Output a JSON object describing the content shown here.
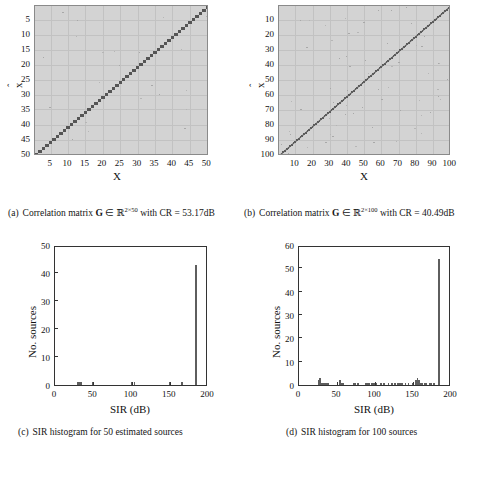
{
  "figure": {
    "panels": [
      {
        "id": "a",
        "type": "matrix",
        "caption_label": "(a)",
        "caption_text_pre": "Correlation matrix",
        "caption_symbol": "G",
        "caption_in": "∈",
        "caption_set": "ℝ",
        "caption_exp": "2×50",
        "caption_text_post": "with CR = 53.17dB",
        "xlabel": "X",
        "ylabel": "x",
        "ylabel_hat": "ˆ",
        "xticks": [
          5,
          10,
          15,
          20,
          25,
          30,
          35,
          40,
          45,
          50
        ],
        "yticks": [
          5,
          10,
          15,
          20,
          25,
          30,
          35,
          40,
          45,
          50
        ],
        "xlim": [
          0.5,
          50.5
        ],
        "ylim": [
          0.5,
          50.5
        ],
        "n": 50,
        "cr_db": 53.17,
        "diagonal": "anti-diagonal, descending left-to-right, dashed/stippled dark marks"
      },
      {
        "id": "b",
        "type": "matrix",
        "caption_label": "(b)",
        "caption_text_pre": "Correlation matrix",
        "caption_symbol": "G",
        "caption_in": "∈",
        "caption_set": "ℝ",
        "caption_exp": "2×100",
        "caption_text_post": "with CR = 40.49dB",
        "xlabel": "X",
        "ylabel": "x",
        "ylabel_hat": "ˆ",
        "xticks": [
          10,
          20,
          30,
          40,
          50,
          60,
          70,
          80,
          90,
          100
        ],
        "yticks": [
          10,
          20,
          30,
          40,
          50,
          60,
          70,
          80,
          90,
          100
        ],
        "xlim": [
          0.5,
          100.5
        ],
        "ylim": [
          0.5,
          100.5
        ],
        "n": 100,
        "cr_db": 40.49,
        "diagonal": "anti-diagonal, descending left-to-right, near-continuous dark line"
      },
      {
        "id": "c",
        "type": "histogram",
        "caption_label": "(c)",
        "caption_full": "SIR histogram for 50 estimated sources",
        "xlabel": "SIR  (dB)",
        "ylabel": "No. sources",
        "xticks": [
          0,
          50,
          100,
          150,
          200
        ],
        "yticks": [
          0,
          10,
          20,
          30,
          40,
          50
        ],
        "xlim": [
          0,
          200
        ],
        "ylim": [
          0,
          50
        ]
      },
      {
        "id": "d",
        "type": "histogram",
        "caption_label": "(d)",
        "caption_full": "SIR histogram for 100 sources",
        "xlabel": "SIR  (dB)",
        "ylabel": "No. sources",
        "xticks": [
          0,
          50,
          100,
          150,
          200
        ],
        "yticks": [
          0,
          10,
          20,
          30,
          40,
          50,
          60
        ],
        "xlim": [
          0,
          200
        ],
        "ylim": [
          0,
          60
        ]
      }
    ]
  },
  "chart_data": [
    {
      "type": "heatmap",
      "id": "a",
      "title": "Correlation matrix G ∈ R^(2×50) with CR = 53.17dB",
      "xlabel": "X",
      "ylabel": "x̂",
      "xlim": [
        0.5,
        50.5
      ],
      "ylim": [
        0.5,
        50.5
      ],
      "xticks": [
        5,
        10,
        15,
        20,
        25,
        30,
        35,
        40,
        45,
        50
      ],
      "yticks": [
        5,
        10,
        15,
        20,
        25,
        30,
        35,
        40,
        45,
        50
      ],
      "grid": true,
      "background_gray": "#d3d3d3",
      "structure": "permuted identity: one dark cell per column along the anti-diagonal (x + x_hat ≈ 51)",
      "n_sources": 50,
      "cr_db": 53.17,
      "diagonal_cells": [
        [
          1,
          50
        ],
        [
          2,
          49
        ],
        [
          3,
          48
        ],
        [
          4,
          47
        ],
        [
          5,
          46
        ],
        [
          6,
          45
        ],
        [
          7,
          44
        ],
        [
          8,
          43
        ],
        [
          9,
          42
        ],
        [
          10,
          41
        ],
        [
          11,
          40
        ],
        [
          12,
          39
        ],
        [
          13,
          38
        ],
        [
          14,
          37
        ],
        [
          15,
          36
        ],
        [
          16,
          35
        ],
        [
          17,
          34
        ],
        [
          18,
          33
        ],
        [
          19,
          32
        ],
        [
          20,
          31
        ],
        [
          21,
          30
        ],
        [
          22,
          29
        ],
        [
          23,
          28
        ],
        [
          24,
          27
        ],
        [
          25,
          26
        ],
        [
          26,
          25
        ],
        [
          27,
          24
        ],
        [
          28,
          23
        ],
        [
          29,
          22
        ],
        [
          30,
          21
        ],
        [
          31,
          20
        ],
        [
          32,
          19
        ],
        [
          33,
          18
        ],
        [
          34,
          17
        ],
        [
          35,
          16
        ],
        [
          36,
          15
        ],
        [
          37,
          14
        ],
        [
          38,
          13
        ],
        [
          39,
          12
        ],
        [
          40,
          11
        ],
        [
          41,
          10
        ],
        [
          42,
          9
        ],
        [
          43,
          8
        ],
        [
          44,
          7
        ],
        [
          45,
          6
        ],
        [
          46,
          5
        ],
        [
          47,
          4
        ],
        [
          48,
          3
        ],
        [
          49,
          2
        ],
        [
          50,
          1
        ]
      ]
    },
    {
      "type": "heatmap",
      "id": "b",
      "title": "Correlation matrix G ∈ R^(2×100) with CR = 40.49dB",
      "xlabel": "X",
      "ylabel": "x̂",
      "xlim": [
        0.5,
        100.5
      ],
      "ylim": [
        0.5,
        100.5
      ],
      "xticks": [
        10,
        20,
        30,
        40,
        50,
        60,
        70,
        80,
        90,
        100
      ],
      "yticks": [
        10,
        20,
        30,
        40,
        50,
        60,
        70,
        80,
        90,
        100
      ],
      "grid": true,
      "background_gray": "#d3d3d3",
      "structure": "permuted identity: one dark cell per column along the anti-diagonal (x + x_hat ≈ 101)",
      "n_sources": 100,
      "cr_db": 40.49
    },
    {
      "type": "bar",
      "id": "c",
      "title": "SIR histogram for 50 estimated sources",
      "xlabel": "SIR  (dB)",
      "ylabel": "No. sources",
      "xlim": [
        0,
        200
      ],
      "ylim": [
        0,
        50
      ],
      "xticks": [
        0,
        50,
        100,
        150,
        200
      ],
      "yticks": [
        0,
        10,
        20,
        30,
        40,
        50
      ],
      "grid": false,
      "bin_width": 2,
      "bins_x": [
        30,
        32,
        34,
        50,
        100,
        104,
        150,
        166,
        184
      ],
      "values": [
        1,
        1,
        1,
        1,
        1,
        1,
        1,
        1,
        43
      ],
      "total_sources": 50,
      "peak": {
        "x": 184,
        "y": 43
      }
    },
    {
      "type": "bar",
      "id": "d",
      "title": "SIR histogram for 100 sources",
      "xlabel": "SIR  (dB)",
      "ylabel": "No. sources",
      "xlim": [
        0,
        200
      ],
      "ylim": [
        0,
        60
      ],
      "xticks": [
        0,
        50,
        100,
        150,
        200
      ],
      "yticks": [
        0,
        10,
        20,
        30,
        40,
        50,
        60
      ],
      "grid": false,
      "bin_width": 2,
      "bins_x": [
        26,
        28,
        30,
        32,
        34,
        36,
        38,
        54,
        56,
        58,
        72,
        74,
        78,
        88,
        90,
        92,
        96,
        98,
        100,
        102,
        108,
        112,
        118,
        122,
        126,
        130,
        132,
        134,
        136,
        140,
        144,
        150,
        154,
        156,
        158,
        160,
        162,
        166,
        168,
        172,
        174,
        178,
        184
      ],
      "values": [
        2,
        3,
        1,
        1,
        1,
        1,
        1,
        2,
        1,
        1,
        1,
        1,
        1,
        1,
        1,
        1,
        1,
        1,
        1,
        1,
        1,
        1,
        1,
        1,
        1,
        1,
        1,
        1,
        1,
        1,
        1,
        1,
        2,
        3,
        2,
        1,
        1,
        1,
        1,
        1,
        1,
        1,
        54
      ],
      "total_sources": 100,
      "peak": {
        "x": 184,
        "y": 54
      }
    }
  ]
}
